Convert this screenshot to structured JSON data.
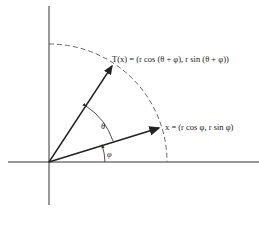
{
  "diagram": {
    "type": "rotation-of-vector",
    "labels": {
      "rotated_vector": "T(x) = (r cos (θ + φ), r sin (θ + φ))",
      "vector": "x = (r cos φ, r sin φ)",
      "theta": "θ",
      "phi": "φ"
    },
    "colors": {
      "line": "#222222",
      "axis": "#333333",
      "arc": "#555555"
    }
  }
}
